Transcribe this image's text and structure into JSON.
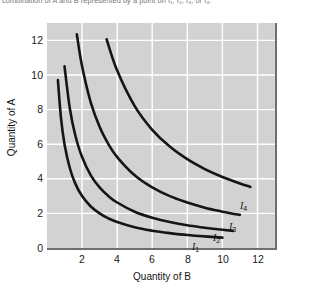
{
  "caption": {
    "text_fragment": "combination of A and B represented by a point on I₁, I₂, I₃, or I₄."
  },
  "axes": {
    "ylabel": "Quantity of A",
    "xlabel": "Quantity of B",
    "yticks": [
      "0",
      "2",
      "4",
      "6",
      "8",
      "10",
      "12"
    ],
    "xticks": [
      "2",
      "4",
      "6",
      "8",
      "10",
      "12"
    ]
  },
  "curve_labels": [
    {
      "name": "I",
      "sub": "1"
    },
    {
      "name": "I",
      "sub": "2"
    },
    {
      "name": "I",
      "sub": "3"
    },
    {
      "name": "I",
      "sub": "4"
    }
  ],
  "colors": {
    "panel_background": "#d2d2d2",
    "gridline": "#ffffff",
    "curve": "#151515",
    "panel_shadow": "#6f6f6f",
    "page_background": "#ffffff",
    "text": "#111111"
  },
  "chart_data": {
    "type": "line",
    "title": "",
    "xlabel": "Quantity of B",
    "ylabel": "Quantity of A",
    "xlim": [
      0,
      13
    ],
    "ylim": [
      0,
      13
    ],
    "xticks": [
      2,
      4,
      6,
      8,
      10,
      12
    ],
    "yticks": [
      0,
      2,
      4,
      6,
      8,
      10,
      12
    ],
    "grid": true,
    "legend": "inline-right-end-labels",
    "series": [
      {
        "name": "I1",
        "k": 6,
        "x": [
          0.62,
          0.8,
          1.0,
          1.3,
          1.6,
          2.0,
          2.5,
          3.0,
          3.5,
          4.0,
          5.0,
          6.0,
          7.0,
          8.0,
          9.0,
          10.0
        ],
        "y": [
          9.7,
          7.5,
          6.0,
          4.62,
          3.75,
          3.0,
          2.4,
          2.0,
          1.71,
          1.5,
          1.2,
          1.0,
          0.86,
          0.75,
          0.67,
          0.6
        ]
      },
      {
        "name": "I2",
        "k": 10.5,
        "x": [
          1.0,
          1.3,
          1.6,
          2.0,
          2.5,
          3.0,
          3.5,
          4.0,
          5.0,
          6.0,
          7.0,
          8.0,
          9.0,
          10.0,
          10.6
        ],
        "y": [
          10.5,
          8.08,
          6.56,
          5.25,
          4.2,
          3.5,
          3.0,
          2.63,
          2.1,
          1.75,
          1.5,
          1.31,
          1.17,
          1.05,
          0.99
        ]
      },
      {
        "name": "I3",
        "k": 21,
        "x": [
          1.7,
          2.0,
          2.5,
          3.0,
          3.5,
          4.0,
          5.0,
          6.0,
          7.0,
          8.0,
          9.0,
          10.0,
          11.0
        ],
        "y": [
          12.35,
          10.5,
          8.4,
          7.0,
          6.0,
          5.25,
          4.2,
          3.5,
          3.0,
          2.63,
          2.33,
          2.1,
          1.91
        ]
      },
      {
        "name": "I4",
        "k": 41,
        "x": [
          3.4,
          4.0,
          5.0,
          6.0,
          7.0,
          8.0,
          9.0,
          10.0,
          11.0,
          11.6
        ],
        "y": [
          12.06,
          10.25,
          8.2,
          6.83,
          5.86,
          5.13,
          4.56,
          4.1,
          3.73,
          3.53
        ]
      }
    ]
  }
}
